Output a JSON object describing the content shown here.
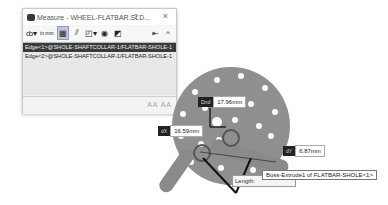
{
  "dialog": {
    "title": "Measure - WHEEL-FLATBAR.SLD...",
    "help_label": "?",
    "close_label": "×",
    "toolbar": {
      "units_label": "in mm",
      "buttons": [
        "arc-circle-options",
        "units-precision",
        "show-xyz",
        "point-to-point",
        "projection",
        "history",
        "create-sensor"
      ],
      "pin_label": "⇤",
      "collapse_label": "^"
    },
    "selections": [
      {
        "label": "Edge<1>@SHOLE-SHAFTCOLLAR-1/FLATBAR-SHOLE-1",
        "selected": true
      },
      {
        "label": "Edge<2>@SHOLE-SHAFTCOLLAR-1/FLATBAR-SHOLE-1",
        "selected": false
      }
    ],
    "footer_text": "AA AA"
  },
  "viewport": {
    "callouts": [
      {
        "tag": "Dnd",
        "value": "17.96mm"
      },
      {
        "tag": "dX",
        "value": "16.59mm"
      },
      {
        "tag": "dY",
        "value": "6.87mm"
      }
    ],
    "length_label": "Length:",
    "tooltip": "Boss-Extrude1 of FLATBAR-SHOLE<1>"
  }
}
